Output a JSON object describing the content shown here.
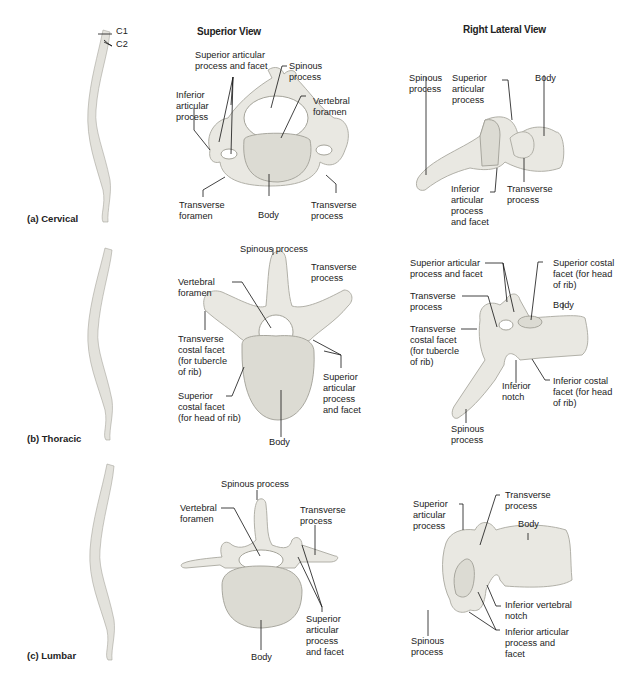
{
  "columns": {
    "superior": "Superior View",
    "lateral": "Right Lateral View"
  },
  "rows": [
    {
      "id": "cervical",
      "label": "(a)  Cervical",
      "spine_markers": [
        "C1",
        "C2"
      ],
      "superior_labels": {
        "sup_art": "Superior articular\nprocess and facet",
        "spinous": "Spinous\nprocess",
        "inf_art": "Inferior\narticular\nprocess",
        "vert_foramen": "Vertebral\nforamen",
        "trans_foramen": "Transverse\nforamen",
        "body": "Body",
        "trans_process": "Transverse\nprocess"
      },
      "lateral_labels": {
        "spinous": "Spinous\nprocess",
        "sup_art": "Superior\narticular\nprocess",
        "body": "Body",
        "inf_art": "Inferior\narticular\nprocess\nand facet",
        "trans_process": "Transverse\nprocess"
      }
    },
    {
      "id": "thoracic",
      "label": "(b)  Thoracic",
      "superior_labels": {
        "spinous": "Spinous process",
        "trans_process": "Transverse\nprocess",
        "vert_foramen": "Vertebral\nforamen",
        "trans_costal": "Transverse\ncostal facet\n(for tubercle\nof rib)",
        "sup_art": "Superior\narticular\nprocess\nand facet",
        "sup_costal": "Superior\ncostal facet\n(for head of rib)",
        "body": "Body"
      },
      "lateral_labels": {
        "sup_art": "Superior articular\nprocess and facet",
        "sup_costal": "Superior costal\nfacet (for head\nof rib)",
        "trans_process": "Transverse\nprocess",
        "body": "Body",
        "trans_costal": "Transverse\ncostal facet\n(for tubercle\nof rib)",
        "inf_notch": "Inferior\nnotch",
        "inf_costal": "Inferior costal\nfacet (for head\nof rib)",
        "spinous": "Spinous\nprocess"
      }
    },
    {
      "id": "lumbar",
      "label": "(c)  Lumbar",
      "superior_labels": {
        "spinous": "Spinous process",
        "vert_foramen": "Vertebral\nforamen",
        "trans_process": "Transverse\nprocess",
        "sup_art": "Superior\narticular\nprocess\nand facet",
        "body": "Body"
      },
      "lateral_labels": {
        "sup_art": "Superior\narticular\nprocess",
        "trans_process": "Transverse\nprocess",
        "body": "Body",
        "inf_notch": "Inferior vertebral\nnotch",
        "inf_art": "Inferior articular\nprocess and\nfacet",
        "spinous": "Spinous\nprocess"
      }
    }
  ]
}
